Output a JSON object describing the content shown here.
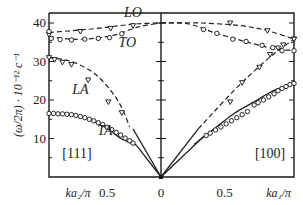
{
  "chart_data": {
    "type": "line",
    "title": "",
    "ylabel": "(ω/2π) · 10⁻¹² c⁻¹",
    "ylim": [
      0,
      42
    ],
    "yticks": [
      10,
      20,
      30,
      40
    ],
    "ytick_labels": [
      "10",
      "20",
      "30",
      "40"
    ],
    "left_panel": {
      "direction": "[111]",
      "xlabel": "ka₂/π",
      "xlim": [
        1,
        0
      ],
      "xtick_labels": [
        {
          "x": 0.5,
          "label": "0.5"
        }
      ],
      "branches": [
        {
          "name": "LO",
          "style": "dashed",
          "marker": "triangle",
          "curve": [
            [
              1.0,
              37.5
            ],
            [
              0.8,
              38.0
            ],
            [
              0.6,
              38.5
            ],
            [
              0.4,
              39.2
            ],
            [
              0.2,
              39.8
            ],
            [
              0.0,
              40.0
            ]
          ],
          "points": [
            [
              1.0,
              37.0
            ],
            [
              0.72,
              37.8
            ],
            [
              0.45,
              38.6
            ],
            [
              0.25,
              39.3
            ]
          ]
        },
        {
          "name": "TO",
          "style": "dashed",
          "marker": "circle",
          "curve": [
            [
              1.0,
              36.5
            ],
            [
              0.8,
              35.8
            ],
            [
              0.6,
              36.0
            ],
            [
              0.4,
              37.0
            ],
            [
              0.2,
              39.0
            ],
            [
              0.0,
              40.0
            ]
          ],
          "points": [
            [
              1.0,
              37.8
            ],
            [
              0.98,
              36.0
            ],
            [
              0.9,
              35.7
            ],
            [
              0.8,
              35.6
            ],
            [
              0.68,
              35.8
            ],
            [
              0.56,
              36.0
            ],
            [
              0.46,
              36.2
            ],
            [
              0.35,
              37.2
            ]
          ]
        },
        {
          "name": "LA",
          "style": "dashed",
          "marker": "triangle",
          "curve": [
            [
              1.0,
              31.0
            ],
            [
              0.8,
              30.0
            ],
            [
              0.6,
              27.0
            ],
            [
              0.45,
              22.5
            ],
            [
              0.35,
              18.0
            ],
            [
              0.28,
              13.0
            ]
          ],
          "points": [
            [
              1.0,
              31.0
            ],
            [
              0.95,
              30.5
            ],
            [
              0.88,
              29.8
            ],
            [
              0.8,
              29.2
            ],
            [
              0.65,
              25.2
            ],
            [
              0.47,
              19.5
            ],
            [
              0.35,
              16.7
            ]
          ]
        },
        {
          "name": "TA",
          "style": "solid",
          "marker": "circle",
          "curve": [
            [
              1.0,
              16.5
            ],
            [
              0.8,
              16.2
            ],
            [
              0.6,
              14.5
            ],
            [
              0.45,
              12.0
            ],
            [
              0.36,
              10.0
            ],
            [
              0.22,
              8.3
            ]
          ],
          "points": [
            [
              1.0,
              16.5
            ],
            [
              0.96,
              16.5
            ],
            [
              0.92,
              16.4
            ],
            [
              0.88,
              16.4
            ],
            [
              0.84,
              16.3
            ],
            [
              0.8,
              16.2
            ],
            [
              0.76,
              16.0
            ],
            [
              0.72,
              15.7
            ],
            [
              0.68,
              15.4
            ],
            [
              0.64,
              15.0
            ],
            [
              0.6,
              14.6
            ],
            [
              0.56,
              14.1
            ],
            [
              0.52,
              13.6
            ],
            [
              0.48,
              12.9
            ],
            [
              0.44,
              12.3
            ],
            [
              0.4,
              11.6
            ],
            [
              0.36,
              10.9
            ],
            [
              0.32,
              10.1
            ],
            [
              0.28,
              9.4
            ],
            [
              0.25,
              8.8
            ]
          ]
        },
        {
          "name": "LA-low",
          "style": "solid",
          "marker": "none",
          "curve": [
            [
              0.0,
              0.0
            ],
            [
              0.25,
              12.5
            ]
          ]
        },
        {
          "name": "TA-low",
          "style": "solid",
          "marker": "none",
          "curve": [
            [
              0.0,
              0.0
            ],
            [
              0.22,
              8.3
            ]
          ]
        }
      ]
    },
    "right_panel": {
      "direction": "[100]",
      "xlabel": "ka₁/π",
      "xlim": [
        0,
        1
      ],
      "xtick_labels": [
        {
          "x": 0,
          "label": "0"
        },
        {
          "x": 0.5,
          "label": "0.5"
        }
      ],
      "branches": [
        {
          "name": "LO",
          "style": "dashed",
          "marker": "triangle",
          "curve": [
            [
              0.0,
              40.0
            ],
            [
              0.3,
              40.0
            ],
            [
              0.6,
              39.3
            ],
            [
              0.8,
              38.0
            ],
            [
              1.0,
              35.8
            ]
          ],
          "points": [
            [
              0.52,
              40.0
            ],
            [
              0.8,
              38.0
            ],
            [
              1.0,
              35.8
            ]
          ]
        },
        {
          "name": "TO",
          "style": "dashed",
          "marker": "circle",
          "curve": [
            [
              0.0,
              40.0
            ],
            [
              0.2,
              39.8
            ],
            [
              0.4,
              37.5
            ],
            [
              0.6,
              35.5
            ],
            [
              0.8,
              33.7
            ],
            [
              0.9,
              33.0
            ],
            [
              1.0,
              33.0
            ]
          ],
          "points": [
            [
              0.32,
              38.3
            ],
            [
              0.42,
              37.3
            ],
            [
              0.54,
              35.8
            ],
            [
              0.64,
              35.2
            ],
            [
              0.76,
              34.2
            ],
            [
              0.84,
              33.6
            ],
            [
              0.91,
              32.8
            ],
            [
              1.0,
              32.8
            ]
          ]
        },
        {
          "name": "LA",
          "style": "dashed",
          "marker": "triangle",
          "curve": [
            [
              0.28,
              12.5
            ],
            [
              0.4,
              17.0
            ],
            [
              0.55,
              22.5
            ],
            [
              0.7,
              27.5
            ],
            [
              0.85,
              32.0
            ],
            [
              1.0,
              35.8
            ]
          ],
          "points": [
            [
              0.52,
              19.5
            ],
            [
              0.61,
              24.5
            ],
            [
              0.74,
              28.5
            ],
            [
              0.82,
              31.8
            ],
            [
              0.88,
              33.5
            ],
            [
              0.92,
              34.3
            ],
            [
              1.0,
              35.8
            ]
          ]
        },
        {
          "name": "TA",
          "style": "solid",
          "marker": "circle",
          "curve": [
            [
              0.25,
              8.5
            ],
            [
              0.4,
              12.5
            ],
            [
              0.55,
              16.5
            ],
            [
              0.7,
              19.5
            ],
            [
              0.85,
              22.5
            ],
            [
              1.0,
              24.2
            ]
          ],
          "points": [
            [
              0.34,
              10.8
            ],
            [
              0.37,
              11.4
            ],
            [
              0.41,
              12.2
            ],
            [
              0.45,
              13.0
            ],
            [
              0.49,
              13.8
            ],
            [
              0.53,
              14.6
            ],
            [
              0.57,
              15.4
            ],
            [
              0.61,
              16.2
            ],
            [
              0.65,
              17.0
            ],
            [
              0.7,
              18.7
            ],
            [
              0.73,
              19.3
            ],
            [
              0.77,
              20.0
            ],
            [
              0.81,
              20.8
            ],
            [
              0.85,
              21.6
            ],
            [
              0.88,
              22.4
            ],
            [
              0.91,
              23.0
            ],
            [
              0.94,
              23.5
            ],
            [
              0.97,
              24.0
            ],
            [
              1.0,
              24.3
            ]
          ]
        },
        {
          "name": "LA-low",
          "style": "solid",
          "marker": "none",
          "curve": [
            [
              0.0,
              0.0
            ],
            [
              0.28,
              12.5
            ]
          ]
        },
        {
          "name": "TA-low",
          "style": "solid",
          "marker": "none",
          "curve": [
            [
              0.0,
              0.0
            ],
            [
              0.32,
              10.5
            ]
          ]
        }
      ]
    },
    "annotations": [
      {
        "text": "LO",
        "panel": "left",
        "x": 0.25,
        "y": 41.5
      },
      {
        "text": "TO",
        "panel": "left",
        "x": 0.3,
        "y": 33.8
      },
      {
        "text": "LA",
        "panel": "left",
        "x": 0.72,
        "y": 21.5
      },
      {
        "text": "TA",
        "panel": "left",
        "x": 0.5,
        "y": 11.0
      },
      {
        "text": "[111]",
        "panel": "left",
        "x": 0.75,
        "y": 5.0,
        "italic": false
      },
      {
        "text": "[100]",
        "panel": "right",
        "x": 0.82,
        "y": 5.0,
        "italic": false
      }
    ]
  }
}
